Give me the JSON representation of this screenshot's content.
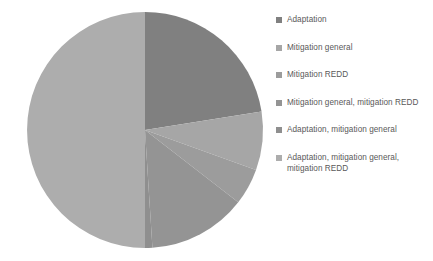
{
  "chart_data": {
    "type": "pie",
    "title": "",
    "subtitle": "",
    "xlabel": "",
    "ylabel": "",
    "grid": false,
    "legend_position": "right",
    "units": "percent",
    "categories": [
      "Adaptation",
      "Mitigation general",
      "Mitigation REDD",
      "Mitigation general, mitigation REDD",
      "Adaptation, mitigation general",
      "Adaptation, mitigation general, mitigation REDD"
    ],
    "values": [
      22.5,
      8.0,
      5.0,
      13.5,
      1.0,
      50.0
    ],
    "colors": [
      "#808080",
      "#a6a6a6",
      "#9c9c9c",
      "#949494",
      "#8f8f8f",
      "#adadad"
    ],
    "start_angle_deg": 0,
    "direction": "clockwise"
  },
  "pie": {
    "center_x": 145,
    "center_y": 130,
    "radius": 118
  },
  "legend": {
    "items": [
      {
        "label": "Adaptation",
        "color": "#808080"
      },
      {
        "label": "Mitigation general",
        "color": "#a6a6a6"
      },
      {
        "label": "Mitigation REDD",
        "color": "#9c9c9c"
      },
      {
        "label": "Mitigation general, mitigation REDD",
        "color": "#949494"
      },
      {
        "label": "Adaptation, mitigation general",
        "color": "#8f8f8f"
      },
      {
        "label": "Adaptation, mitigation general, mitigation REDD",
        "color": "#adadad"
      }
    ]
  },
  "background_color": "#ffffff"
}
